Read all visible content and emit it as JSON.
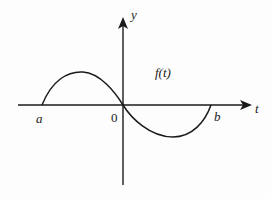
{
  "diagram": {
    "title": "",
    "axes": {
      "x_label": "t",
      "y_label": "y",
      "origin_label": "0"
    },
    "points": {
      "left_endpoint": "a",
      "right_endpoint": "b"
    },
    "curve": {
      "label": "f(t)",
      "description": "One full inverted-sine-like period from a to b: positive hump on [a,0], passes through origin, negative trough on [0,b]"
    },
    "colors": {
      "line": "#1a1a1a",
      "background": "#fdfdfd"
    }
  }
}
